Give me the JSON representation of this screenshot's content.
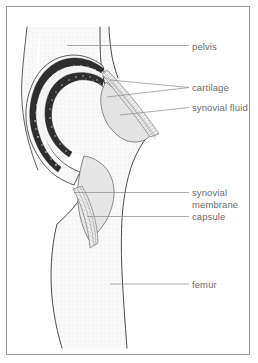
{
  "figure": {
    "type": "anatomical-line-drawing",
    "border_color": "#9a9a9a",
    "background_color": "#ffffff",
    "outline_color": "#3a3a3a",
    "label_color": "#6e6e6e",
    "leader_color": "#8a8a8a",
    "bone_fill": "#fbfbfb",
    "bone_shade": "#f2f2f2",
    "synovial_fluid_fill": "#e4e4e4",
    "cartilage_fill": "#2b2b2b"
  },
  "labels": [
    {
      "id": "pelvis",
      "text": "pelvis",
      "x": 192,
      "y": 41,
      "leader": {
        "x1": 67,
        "y1": 45.5,
        "x2": 189,
        "y2": 45.5
      }
    },
    {
      "id": "cartilage",
      "text": "cartilage",
      "x": 192,
      "y": 83,
      "leader": {
        "x1": 110,
        "y1": 80,
        "x2": 189,
        "y2": 87.5
      },
      "leader2": {
        "x1": 107,
        "y1": 97,
        "x2": 189,
        "y2": 87.5
      }
    },
    {
      "id": "synovial-fluid",
      "text": "synovial fluid",
      "x": 192,
      "y": 103,
      "leader": {
        "x1": 120,
        "y1": 115,
        "x2": 189,
        "y2": 107.5
      }
    },
    {
      "id": "synovial-membrane",
      "text": "synovial membrane",
      "line1": "synovial",
      "line2": "membrane",
      "x": 192,
      "y": 187,
      "leader": {
        "x1": 74,
        "y1": 192.5,
        "x2": 189,
        "y2": 192.5
      }
    },
    {
      "id": "capsule",
      "text": "capsule",
      "x": 192,
      "y": 211,
      "leader": {
        "x1": 87,
        "y1": 216.5,
        "x2": 189,
        "y2": 216.5
      }
    },
    {
      "id": "femur",
      "text": "femur",
      "x": 192,
      "y": 279,
      "leader": {
        "x1": 110,
        "y1": 284,
        "x2": 189,
        "y2": 284
      }
    }
  ]
}
